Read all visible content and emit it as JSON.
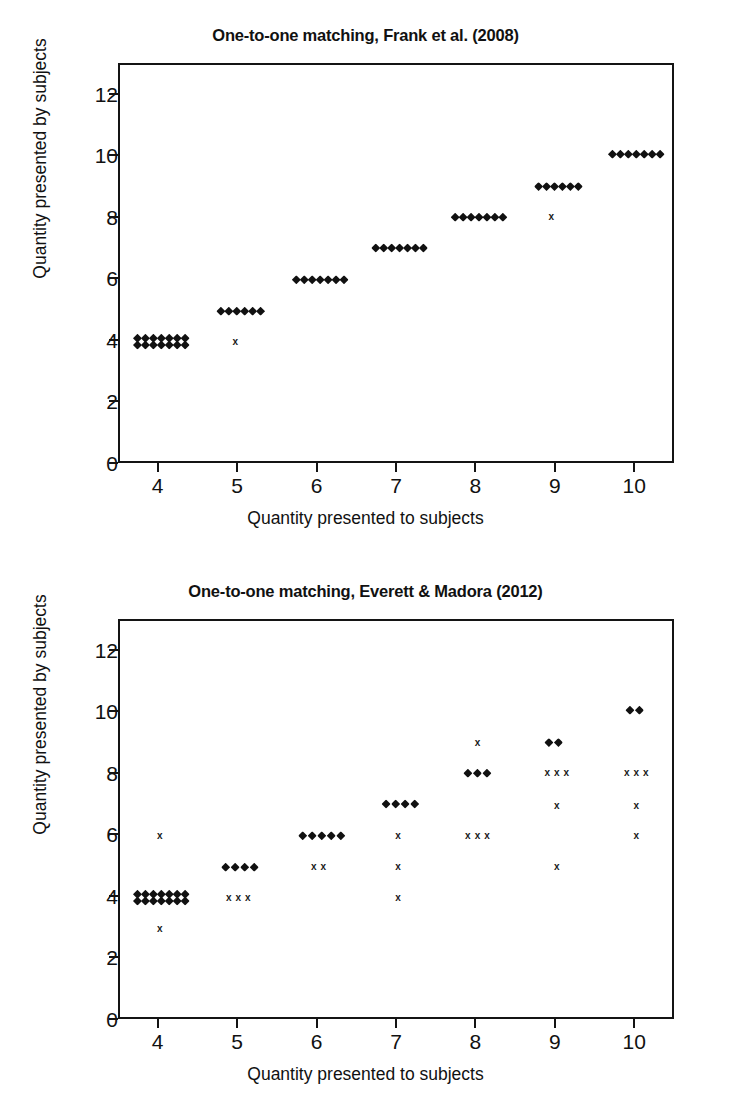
{
  "figure": {
    "axis_labels": {
      "x": "Quantity presented to subjects",
      "y": "Quantity presented by subjects"
    },
    "marker_names": {
      "diamond": "diamond-marker",
      "cross": "x-marker"
    }
  },
  "chart_data": [
    {
      "type": "scatter",
      "id": "frank-2008",
      "title": "One-to-one matching, Frank et al. (2008)",
      "xlabel": "Quantity presented to subjects",
      "ylabel": "Quantity presented by subjects",
      "xlim": [
        3.5,
        10.5
      ],
      "ylim": [
        0,
        13
      ],
      "xticks": [
        4,
        5,
        6,
        7,
        8,
        9,
        10
      ],
      "yticks": [
        0,
        2,
        4,
        6,
        8,
        10,
        12
      ],
      "grid": false,
      "legend": null,
      "series": [
        {
          "name": "Matching responses",
          "marker": "diamond",
          "points": [
            {
              "x": 3.72,
              "y": 4.12
            },
            {
              "x": 3.82,
              "y": 4.12
            },
            {
              "x": 3.92,
              "y": 4.12
            },
            {
              "x": 4.02,
              "y": 4.12
            },
            {
              "x": 4.12,
              "y": 4.12
            },
            {
              "x": 4.22,
              "y": 4.12
            },
            {
              "x": 4.32,
              "y": 4.12
            },
            {
              "x": 3.72,
              "y": 3.9
            },
            {
              "x": 3.82,
              "y": 3.9
            },
            {
              "x": 3.92,
              "y": 3.9
            },
            {
              "x": 4.02,
              "y": 3.9
            },
            {
              "x": 4.12,
              "y": 3.9
            },
            {
              "x": 4.22,
              "y": 3.9
            },
            {
              "x": 4.32,
              "y": 3.9
            },
            {
              "x": 4.77,
              "y": 5.0
            },
            {
              "x": 4.87,
              "y": 5.0
            },
            {
              "x": 4.97,
              "y": 5.0
            },
            {
              "x": 5.07,
              "y": 5.0
            },
            {
              "x": 5.17,
              "y": 5.0
            },
            {
              "x": 5.27,
              "y": 5.0
            },
            {
              "x": 5.72,
              "y": 6.02
            },
            {
              "x": 5.82,
              "y": 6.02
            },
            {
              "x": 5.92,
              "y": 6.02
            },
            {
              "x": 6.02,
              "y": 6.02
            },
            {
              "x": 6.12,
              "y": 6.02
            },
            {
              "x": 6.22,
              "y": 6.02
            },
            {
              "x": 6.32,
              "y": 6.02
            },
            {
              "x": 6.72,
              "y": 7.05
            },
            {
              "x": 6.82,
              "y": 7.05
            },
            {
              "x": 6.92,
              "y": 7.05
            },
            {
              "x": 7.02,
              "y": 7.05
            },
            {
              "x": 7.12,
              "y": 7.05
            },
            {
              "x": 7.22,
              "y": 7.05
            },
            {
              "x": 7.32,
              "y": 7.05
            },
            {
              "x": 7.72,
              "y": 8.05
            },
            {
              "x": 7.82,
              "y": 8.05
            },
            {
              "x": 7.92,
              "y": 8.05
            },
            {
              "x": 8.02,
              "y": 8.05
            },
            {
              "x": 8.12,
              "y": 8.05
            },
            {
              "x": 8.22,
              "y": 8.05
            },
            {
              "x": 8.32,
              "y": 8.05
            },
            {
              "x": 8.77,
              "y": 9.05
            },
            {
              "x": 8.87,
              "y": 9.05
            },
            {
              "x": 8.97,
              "y": 9.05
            },
            {
              "x": 9.07,
              "y": 9.05
            },
            {
              "x": 9.17,
              "y": 9.05
            },
            {
              "x": 9.27,
              "y": 9.05
            },
            {
              "x": 9.7,
              "y": 10.1
            },
            {
              "x": 9.8,
              "y": 10.1
            },
            {
              "x": 9.9,
              "y": 10.1
            },
            {
              "x": 10.0,
              "y": 10.1
            },
            {
              "x": 10.1,
              "y": 10.1
            },
            {
              "x": 10.2,
              "y": 10.1
            },
            {
              "x": 10.3,
              "y": 10.1
            }
          ]
        },
        {
          "name": "Non-matching responses",
          "marker": "cross",
          "points": [
            {
              "x": 4.95,
              "y": 4.0
            },
            {
              "x": 8.93,
              "y": 8.07
            }
          ]
        }
      ]
    },
    {
      "type": "scatter",
      "id": "everett-madora-2012",
      "title": "One-to-one matching, Everett & Madora (2012)",
      "xlabel": "Quantity presented to subjects",
      "ylabel": "Quantity presented by subjects",
      "xlim": [
        3.5,
        10.5
      ],
      "ylim": [
        0,
        13
      ],
      "xticks": [
        4,
        5,
        6,
        7,
        8,
        9,
        10
      ],
      "yticks": [
        0,
        2,
        4,
        6,
        8,
        10,
        12
      ],
      "grid": false,
      "legend": null,
      "series": [
        {
          "name": "Matching responses",
          "marker": "diamond",
          "points": [
            {
              "x": 3.72,
              "y": 4.12
            },
            {
              "x": 3.82,
              "y": 4.12
            },
            {
              "x": 3.92,
              "y": 4.12
            },
            {
              "x": 4.02,
              "y": 4.12
            },
            {
              "x": 4.12,
              "y": 4.12
            },
            {
              "x": 4.22,
              "y": 4.12
            },
            {
              "x": 4.32,
              "y": 4.12
            },
            {
              "x": 3.72,
              "y": 3.9
            },
            {
              "x": 3.82,
              "y": 3.9
            },
            {
              "x": 3.92,
              "y": 3.9
            },
            {
              "x": 4.02,
              "y": 3.9
            },
            {
              "x": 4.12,
              "y": 3.9
            },
            {
              "x": 4.22,
              "y": 3.9
            },
            {
              "x": 4.32,
              "y": 3.9
            },
            {
              "x": 4.83,
              "y": 5.0
            },
            {
              "x": 4.95,
              "y": 5.0
            },
            {
              "x": 5.07,
              "y": 5.0
            },
            {
              "x": 5.19,
              "y": 5.0
            },
            {
              "x": 5.8,
              "y": 6.02
            },
            {
              "x": 5.92,
              "y": 6.02
            },
            {
              "x": 6.04,
              "y": 6.02
            },
            {
              "x": 6.16,
              "y": 6.02
            },
            {
              "x": 6.28,
              "y": 6.02
            },
            {
              "x": 6.85,
              "y": 7.05
            },
            {
              "x": 6.97,
              "y": 7.05
            },
            {
              "x": 7.09,
              "y": 7.05
            },
            {
              "x": 7.21,
              "y": 7.05
            },
            {
              "x": 7.88,
              "y": 8.05
            },
            {
              "x": 8.0,
              "y": 8.05
            },
            {
              "x": 8.12,
              "y": 8.05
            },
            {
              "x": 8.9,
              "y": 9.05
            },
            {
              "x": 9.02,
              "y": 9.05
            },
            {
              "x": 9.92,
              "y": 10.1
            },
            {
              "x": 10.04,
              "y": 10.1
            }
          ]
        },
        {
          "name": "Non-matching responses",
          "marker": "cross",
          "points": [
            {
              "x": 4.0,
              "y": 6.0
            },
            {
              "x": 4.0,
              "y": 3.0
            },
            {
              "x": 4.87,
              "y": 4.0
            },
            {
              "x": 4.99,
              "y": 4.0
            },
            {
              "x": 5.11,
              "y": 4.0
            },
            {
              "x": 5.94,
              "y": 5.0
            },
            {
              "x": 6.06,
              "y": 5.0
            },
            {
              "x": 7.0,
              "y": 6.0
            },
            {
              "x": 7.0,
              "y": 5.0
            },
            {
              "x": 7.0,
              "y": 4.0
            },
            {
              "x": 8.0,
              "y": 9.05
            },
            {
              "x": 7.88,
              "y": 6.0
            },
            {
              "x": 8.0,
              "y": 6.0
            },
            {
              "x": 8.12,
              "y": 6.0
            },
            {
              "x": 8.88,
              "y": 8.05
            },
            {
              "x": 9.0,
              "y": 8.05
            },
            {
              "x": 9.12,
              "y": 8.05
            },
            {
              "x": 9.0,
              "y": 7.0
            },
            {
              "x": 9.0,
              "y": 5.0
            },
            {
              "x": 9.88,
              "y": 8.05
            },
            {
              "x": 10.0,
              "y": 8.05
            },
            {
              "x": 10.12,
              "y": 8.05
            },
            {
              "x": 10.0,
              "y": 7.0
            },
            {
              "x": 10.0,
              "y": 6.0
            }
          ]
        }
      ]
    }
  ]
}
